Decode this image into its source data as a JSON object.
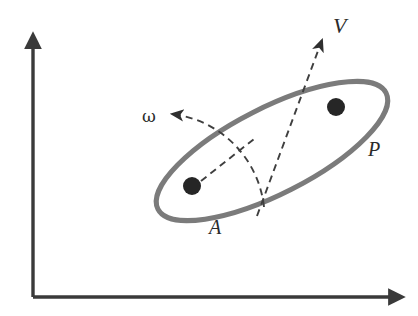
{
  "figure": {
    "width": 418,
    "height": 316,
    "background_color": "#ffffff"
  },
  "colors": {
    "axis": "#3a3a3a",
    "body_outline": "#7b7b7b",
    "dashed_line": "#3f3f3f",
    "marker_fill": "#262626",
    "label_text": "#2b2b2b"
  },
  "axes": {
    "name": "coordinate-axes",
    "origin": {
      "x": 33,
      "y": 297
    },
    "x_axis": {
      "from_x": 33,
      "to_x": 392,
      "y": 297,
      "arrow": "right"
    },
    "y_axis": {
      "x": 33,
      "from_y": 297,
      "to_y": 45,
      "arrow": "up"
    },
    "stroke_width": 3.4,
    "x_label": "",
    "y_label": ""
  },
  "body": {
    "name": "rigid-body-ellipse",
    "label": "P",
    "label_x": 368,
    "label_y": 156,
    "center_x": 272,
    "center_y": 151,
    "radius_x": 128,
    "radius_y": 43,
    "rotation_deg": -27,
    "stroke_width": 5
  },
  "markers": [
    {
      "name": "point-a",
      "label": "A",
      "x": 192,
      "y": 186,
      "radius": 9,
      "label_x": 209,
      "label_y": 234
    },
    {
      "name": "point-p",
      "label": "",
      "x": 336,
      "y": 107,
      "radius": 9,
      "label_x": 0,
      "label_y": 0
    }
  ],
  "vectors": [
    {
      "name": "velocity-vector",
      "label": "V",
      "style": "dashed",
      "from_x": 257,
      "from_y": 216,
      "to_x": 322,
      "to_y": 40,
      "arrow": "end",
      "label_x": 333,
      "label_y": 33,
      "label_font_size": 22
    },
    {
      "name": "angular-velocity-arc",
      "label": "ω",
      "style": "dashed-arc",
      "arc_start_x": 264,
      "arc_start_y": 207,
      "arc_end_x": 172,
      "arc_end_y": 114,
      "arc_radius": 105,
      "arrow": "end",
      "label_x": 142,
      "label_y": 122,
      "label_font_size": 17
    },
    {
      "name": "radius-line-a",
      "label": "",
      "style": "dashed",
      "from_x": 201,
      "from_y": 181,
      "to_x": 254,
      "to_y": 139,
      "arrow": "none"
    }
  ],
  "dash_pattern": "7,5",
  "dash_width": 1.9
}
